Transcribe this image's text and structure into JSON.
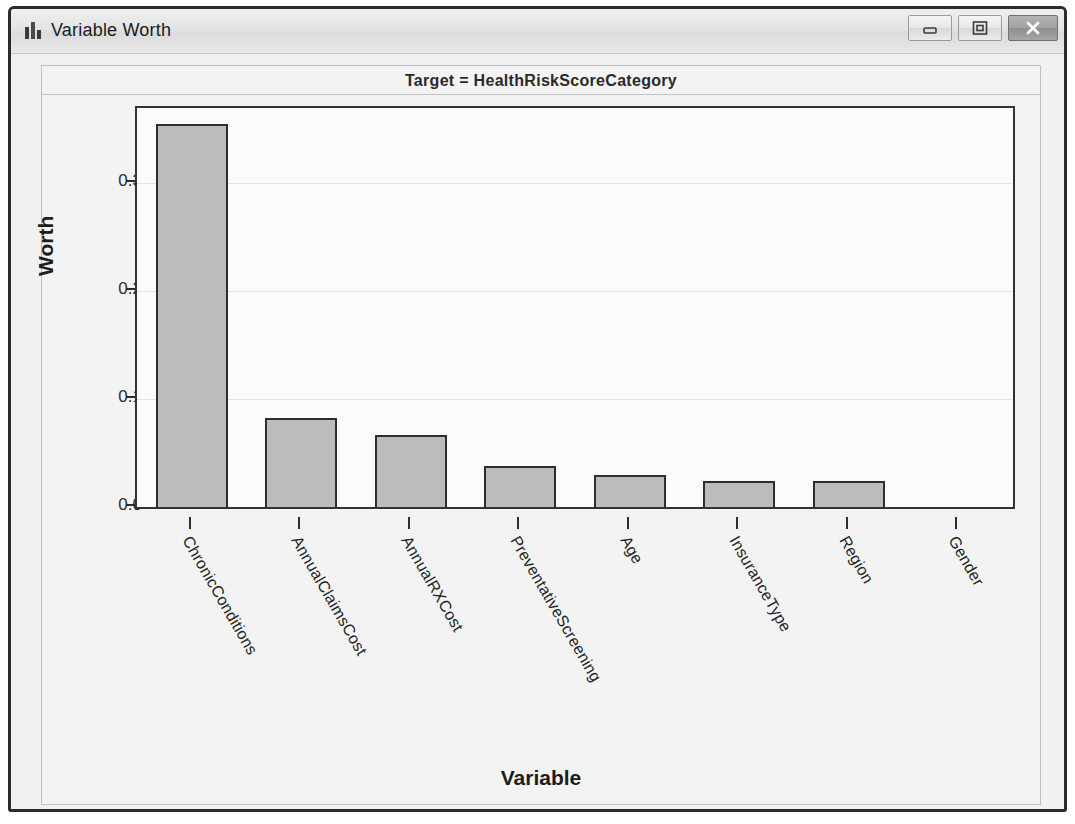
{
  "window": {
    "title": "Variable Worth",
    "icon": "bar-chart-icon",
    "controls": {
      "minimize": "Minimize",
      "maximize": "Maximize",
      "close": "Close"
    }
  },
  "chart_data": {
    "type": "bar",
    "title": "Target = HealthRiskScoreCategory",
    "xlabel": "Variable",
    "ylabel": "Worth",
    "categories": [
      "ChronicConditions",
      "AnnualClaimsCost",
      "AnnualRXCost",
      "PreventativeScreening",
      "Age",
      "InsuranceType",
      "Region",
      "Gender"
    ],
    "values": [
      0.355,
      0.083,
      0.067,
      0.038,
      0.03,
      0.024,
      0.024,
      0.0
    ],
    "ylim": [
      0.0,
      0.37
    ],
    "yticks": [
      0.0,
      0.1,
      0.2,
      0.3
    ],
    "ytick_labels": [
      "0.0",
      "0.1",
      "0.2",
      "0.3"
    ],
    "grid": true,
    "legend": "none",
    "colors": {
      "bar_fill": "#bcbcbc",
      "bar_border": "#2e2e2e",
      "plot_background": "#fbfbfb",
      "gridline": "#e3e3e3",
      "frame_background": "#f3f3f3"
    }
  }
}
